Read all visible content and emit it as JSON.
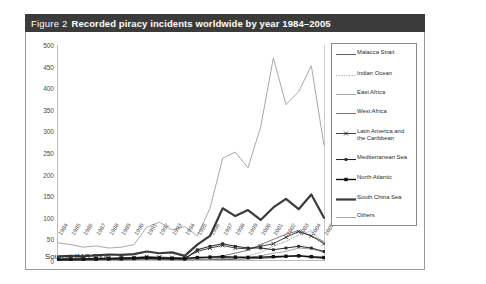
{
  "figure": {
    "label": "Figure 2",
    "title": "Recorded piracy incidents worldwide by year 1984–2005",
    "source": "Source: IMO 2006"
  },
  "chart_data": {
    "type": "line",
    "title": "Recorded piracy incidents worldwide by year 1984–2005",
    "xlabel": "",
    "ylabel": "",
    "ylim": [
      0,
      500
    ],
    "ytick_step": 50,
    "yticks": [
      0,
      50,
      100,
      150,
      200,
      250,
      300,
      350,
      400,
      450,
      500
    ],
    "grid": false,
    "legend_position": "right",
    "categories": [
      "1984",
      "1985",
      "1986",
      "1987",
      "1988",
      "1989",
      "1990",
      "1991",
      "1992",
      "1993",
      "1994",
      "1995",
      "1996",
      "1997",
      "1998",
      "1999",
      "2000",
      "2001",
      "2002",
      "2003",
      "2004",
      "2005"
    ],
    "series": [
      {
        "name": "Malacca Strait",
        "style": "thin-solid",
        "color": "#4d4d4d",
        "width": 0.9,
        "marker": "none",
        "values": [
          2,
          3,
          2,
          3,
          4,
          4,
          5,
          6,
          5,
          4,
          3,
          5,
          4,
          3,
          4,
          5,
          6,
          8,
          10,
          12,
          8,
          6
        ]
      },
      {
        "name": "Indian Ocean",
        "style": "dotted",
        "color": "#9a9a9a",
        "width": 0.8,
        "marker": "none",
        "values": [
          1,
          1,
          2,
          2,
          3,
          3,
          4,
          5,
          4,
          3,
          3,
          4,
          5,
          6,
          8,
          12,
          20,
          35,
          45,
          60,
          70,
          40
        ]
      },
      {
        "name": "East Africa",
        "style": "thin-solid-light",
        "color": "#8a8a8a",
        "width": 0.8,
        "marker": "none",
        "values": [
          1,
          1,
          1,
          2,
          2,
          2,
          3,
          4,
          3,
          3,
          2,
          3,
          4,
          5,
          6,
          8,
          12,
          18,
          22,
          30,
          28,
          20
        ]
      },
      {
        "name": "West Africa",
        "style": "thin-solid-mid",
        "color": "#6a6a6a",
        "width": 0.9,
        "marker": "none",
        "values": [
          2,
          3,
          3,
          4,
          5,
          5,
          6,
          8,
          7,
          6,
          5,
          7,
          9,
          12,
          18,
          25,
          38,
          50,
          62,
          70,
          58,
          45
        ]
      },
      {
        "name": "Latin America and the Caribbean",
        "style": "marker-line",
        "color": "#2b2b2b",
        "width": 0.9,
        "marker": "x",
        "values": [
          3,
          4,
          4,
          5,
          6,
          6,
          8,
          10,
          9,
          8,
          7,
          22,
          30,
          36,
          30,
          28,
          34,
          40,
          55,
          68,
          58,
          40
        ]
      },
      {
        "name": "Mediterranean Sea",
        "style": "marker-line",
        "color": "#2b2b2b",
        "width": 1.1,
        "marker": "square-small",
        "values": [
          2,
          2,
          3,
          3,
          4,
          4,
          5,
          6,
          5,
          5,
          4,
          26,
          34,
          40,
          34,
          30,
          30,
          26,
          30,
          34,
          30,
          22
        ]
      },
      {
        "name": "North Atlantic",
        "style": "marker-line-bold",
        "color": "#111111",
        "width": 1.4,
        "marker": "square",
        "values": [
          4,
          5,
          5,
          6,
          6,
          7,
          7,
          8,
          7,
          6,
          6,
          8,
          9,
          10,
          9,
          8,
          9,
          10,
          11,
          12,
          10,
          8
        ]
      },
      {
        "name": "South China Sea",
        "style": "thick-solid",
        "color": "#3a3a3a",
        "width": 2.2,
        "marker": "none",
        "values": [
          10,
          12,
          11,
          13,
          15,
          14,
          16,
          22,
          18,
          20,
          12,
          38,
          58,
          122,
          104,
          118,
          95,
          124,
          144,
          120,
          154,
          100
        ]
      },
      {
        "name": "Others",
        "style": "thin-solid-pale",
        "color": "#9e9e9e",
        "width": 0.9,
        "marker": "none",
        "values": [
          42,
          38,
          32,
          35,
          30,
          32,
          38,
          78,
          90,
          72,
          80,
          58,
          122,
          238,
          252,
          216,
          310,
          470,
          362,
          392,
          452,
          268
        ]
      }
    ]
  }
}
